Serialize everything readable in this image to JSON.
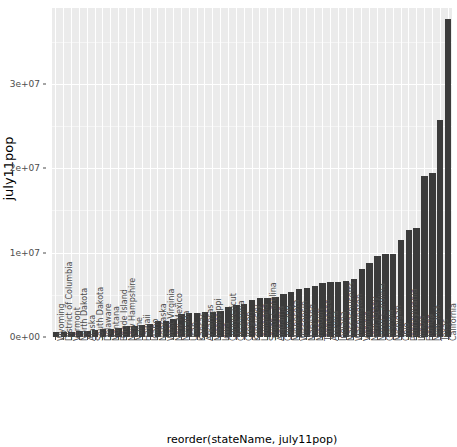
{
  "chart_data": {
    "type": "bar",
    "title": "",
    "subtitle": "",
    "xlabel": "reorder(stateName, july11pop)",
    "ylabel": "july11pop",
    "ylim": [
      0,
      39000000
    ],
    "ytick_values": [
      0,
      10000000,
      20000000,
      30000000
    ],
    "ytick_labels": [
      "0e+00",
      "1e+07",
      "2e+07",
      "3e+07"
    ],
    "grid": true,
    "legend": "none",
    "orientation": "vertical",
    "sort": "ascending",
    "bar_color": "#3b3b3b",
    "panel_background": "#ebebeb",
    "gridline_color": "#ffffff",
    "categories": [
      "Wyoming",
      "District of Columbia",
      "Vermont",
      "North Dakota",
      "Alaska",
      "South Dakota",
      "Delaware",
      "Montana",
      "Rhode Island",
      "New Hampshire",
      "Maine",
      "Hawaii",
      "Idaho",
      "Nebraska",
      "West Virginia",
      "New Mexico",
      "Nevada",
      "Utah",
      "Kansas",
      "Arkansas",
      "Mississippi",
      "Iowa",
      "Connecticut",
      "Oklahoma",
      "Oregon",
      "Kentucky",
      "Louisiana",
      "South Carolina",
      "Alabama",
      "Colorado",
      "Minnesota",
      "Wisconsin",
      "Maryland",
      "Missouri",
      "Tennessee",
      "Arizona",
      "Indiana",
      "Massachusetts",
      "Washington",
      "Virginia",
      "New Jersey",
      "North Carolina",
      "Georgia",
      "Michigan",
      "Ohio",
      "Pennsylvania",
      "Illinois",
      "Florida",
      "New York",
      "Texas",
      "California"
    ],
    "values": [
      568158,
      617996,
      626431,
      683932,
      722718,
      824082,
      907135,
      998199,
      1051302,
      1318194,
      1328188,
      1374810,
      1584985,
      1842641,
      1855364,
      2082224,
      2723322,
      2817222,
      2871238,
      2937979,
      2978512,
      3062309,
      3580709,
      3791508,
      3871859,
      4369356,
      4574836,
      4679230,
      4802740,
      5116796,
      5344861,
      5711767,
      5828289,
      6010688,
      6403353,
      6482505,
      6516922,
      6587536,
      6830038,
      8096604,
      8821155,
      9656401,
      9815210,
      9876187,
      11544951,
      12742886,
      12869257,
      19057542,
      19465197,
      25674681,
      37691912
    ]
  }
}
